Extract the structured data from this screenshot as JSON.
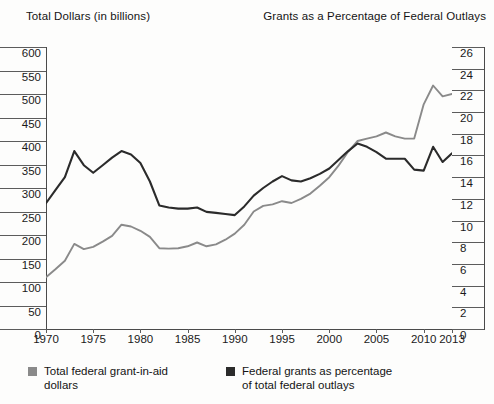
{
  "axis_titles": {
    "left": "Total Dollars (in billions)",
    "right": "Grants as a Percentage of Federal Outlays"
  },
  "legend": {
    "items": [
      {
        "label": "Total federal grant-in-aid dollars",
        "color": "#8a8a8a"
      },
      {
        "label": "Federal grants as percentage of total federal outlays",
        "color": "#2b2b2b"
      }
    ]
  },
  "chart_data": {
    "type": "line",
    "title": "",
    "xlabel": "",
    "ylabel": "Total Dollars (in billions)",
    "y2label": "Grants as a Percentage of Federal Outlays",
    "grid": false,
    "legend_position": "bottom",
    "xlim": [
      1970,
      2013
    ],
    "ylim": [
      0,
      600
    ],
    "y2lim": [
      0,
      26
    ],
    "yticks": [
      0,
      50,
      100,
      150,
      200,
      250,
      300,
      350,
      400,
      450,
      500,
      550,
      600
    ],
    "y2ticks": [
      0,
      2,
      4,
      6,
      8,
      10,
      12,
      14,
      16,
      18,
      20,
      22,
      24,
      26
    ],
    "xticks": [
      1970,
      1975,
      1980,
      1985,
      1990,
      1995,
      2000,
      2005,
      2010,
      2013
    ],
    "x": [
      1970,
      1971,
      1972,
      1973,
      1974,
      1975,
      1976,
      1977,
      1978,
      1979,
      1980,
      1981,
      1982,
      1983,
      1984,
      1985,
      1986,
      1987,
      1988,
      1989,
      1990,
      1991,
      1992,
      1993,
      1994,
      1995,
      1996,
      1997,
      1998,
      1999,
      2000,
      2001,
      2002,
      2003,
      2004,
      2005,
      2006,
      2007,
      2008,
      2009,
      2010,
      2011,
      2012,
      2013
    ],
    "series": [
      {
        "name": "Total federal grant-in-aid dollars",
        "axis": "left",
        "units": "billions of dollars",
        "color": "#8a8a8a",
        "values": [
          110,
          127,
          145,
          181,
          170,
          175,
          186,
          198,
          222,
          218,
          209,
          196,
          172,
          171,
          172,
          176,
          184,
          176,
          180,
          190,
          203,
          222,
          250,
          262,
          265,
          272,
          268,
          277,
          288,
          305,
          323,
          348,
          377,
          400,
          405,
          410,
          418,
          410,
          405,
          405,
          478,
          518,
          495,
          500
        ]
      },
      {
        "name": "Federal grants as percentage of total federal outlays",
        "axis": "right",
        "units": "percent",
        "color": "#2b2b2b",
        "values": [
          11.6,
          12.8,
          14.0,
          16.4,
          15.1,
          14.4,
          15.1,
          15.8,
          16.4,
          16.1,
          15.3,
          13.6,
          11.4,
          11.2,
          11.1,
          11.1,
          11.2,
          10.8,
          10.7,
          10.6,
          10.5,
          11.3,
          12.3,
          13.0,
          13.6,
          14.1,
          13.7,
          13.6,
          13.9,
          14.3,
          14.8,
          15.6,
          16.4,
          17.1,
          16.8,
          16.3,
          15.7,
          15.7,
          15.7,
          14.7,
          14.6,
          16.8,
          15.4,
          16.2
        ]
      }
    ]
  }
}
